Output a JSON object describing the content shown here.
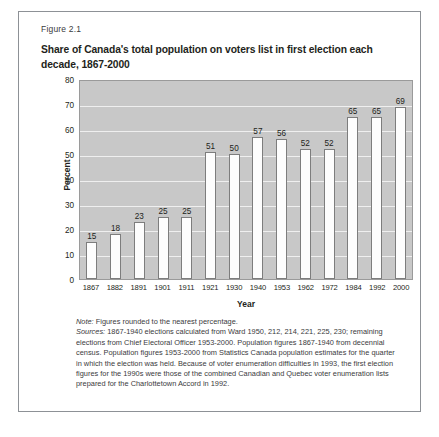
{
  "figure": {
    "number": "Figure 2.1",
    "title": "Share of Canada's total population on voters list in first election each decade, 1867-2000"
  },
  "chart_data": {
    "type": "bar",
    "title": "Share of Canada's total population on voters list in first election each decade, 1867-2000",
    "xlabel": "Year",
    "ylabel": "Percent",
    "categories": [
      "1867",
      "1882",
      "1891",
      "1901",
      "1911",
      "1921",
      "1930",
      "1940",
      "1953",
      "1962",
      "1972",
      "1984",
      "1992",
      "2000"
    ],
    "values": [
      15,
      18,
      23,
      25,
      25,
      51,
      50,
      57,
      56,
      52,
      52,
      65,
      65,
      69
    ],
    "ylim": [
      0,
      80
    ],
    "yticks": [
      0,
      10,
      20,
      30,
      40,
      50,
      60,
      70,
      80
    ],
    "grid": true,
    "legend": "none",
    "plot_background": "#c8c8c8",
    "bar_fill": "#fdfdfd",
    "bar_stroke": "#7d7d7d"
  },
  "notes": {
    "note_label": "Note:",
    "note_text": " Figures rounded to the nearest percentage.",
    "sources_label": "Sources:",
    "sources_text": " 1867-1940 elections calculated from Ward 1950, 212, 214, 221, 225, 230; remaining elections from Chief Electoral Officer 1953-2000. Population figures 1867-1940 from decennial census. Population figures 1953-2000 from Statistics Canada population estimates for the quarter in which the election was held. Because of voter enumeration difficulties in 1993, the first election figures for the 1990s were those of the combined Canadian and Quebec voter enumeration lists prepared for the Charlottetown Accord in 1992."
  }
}
